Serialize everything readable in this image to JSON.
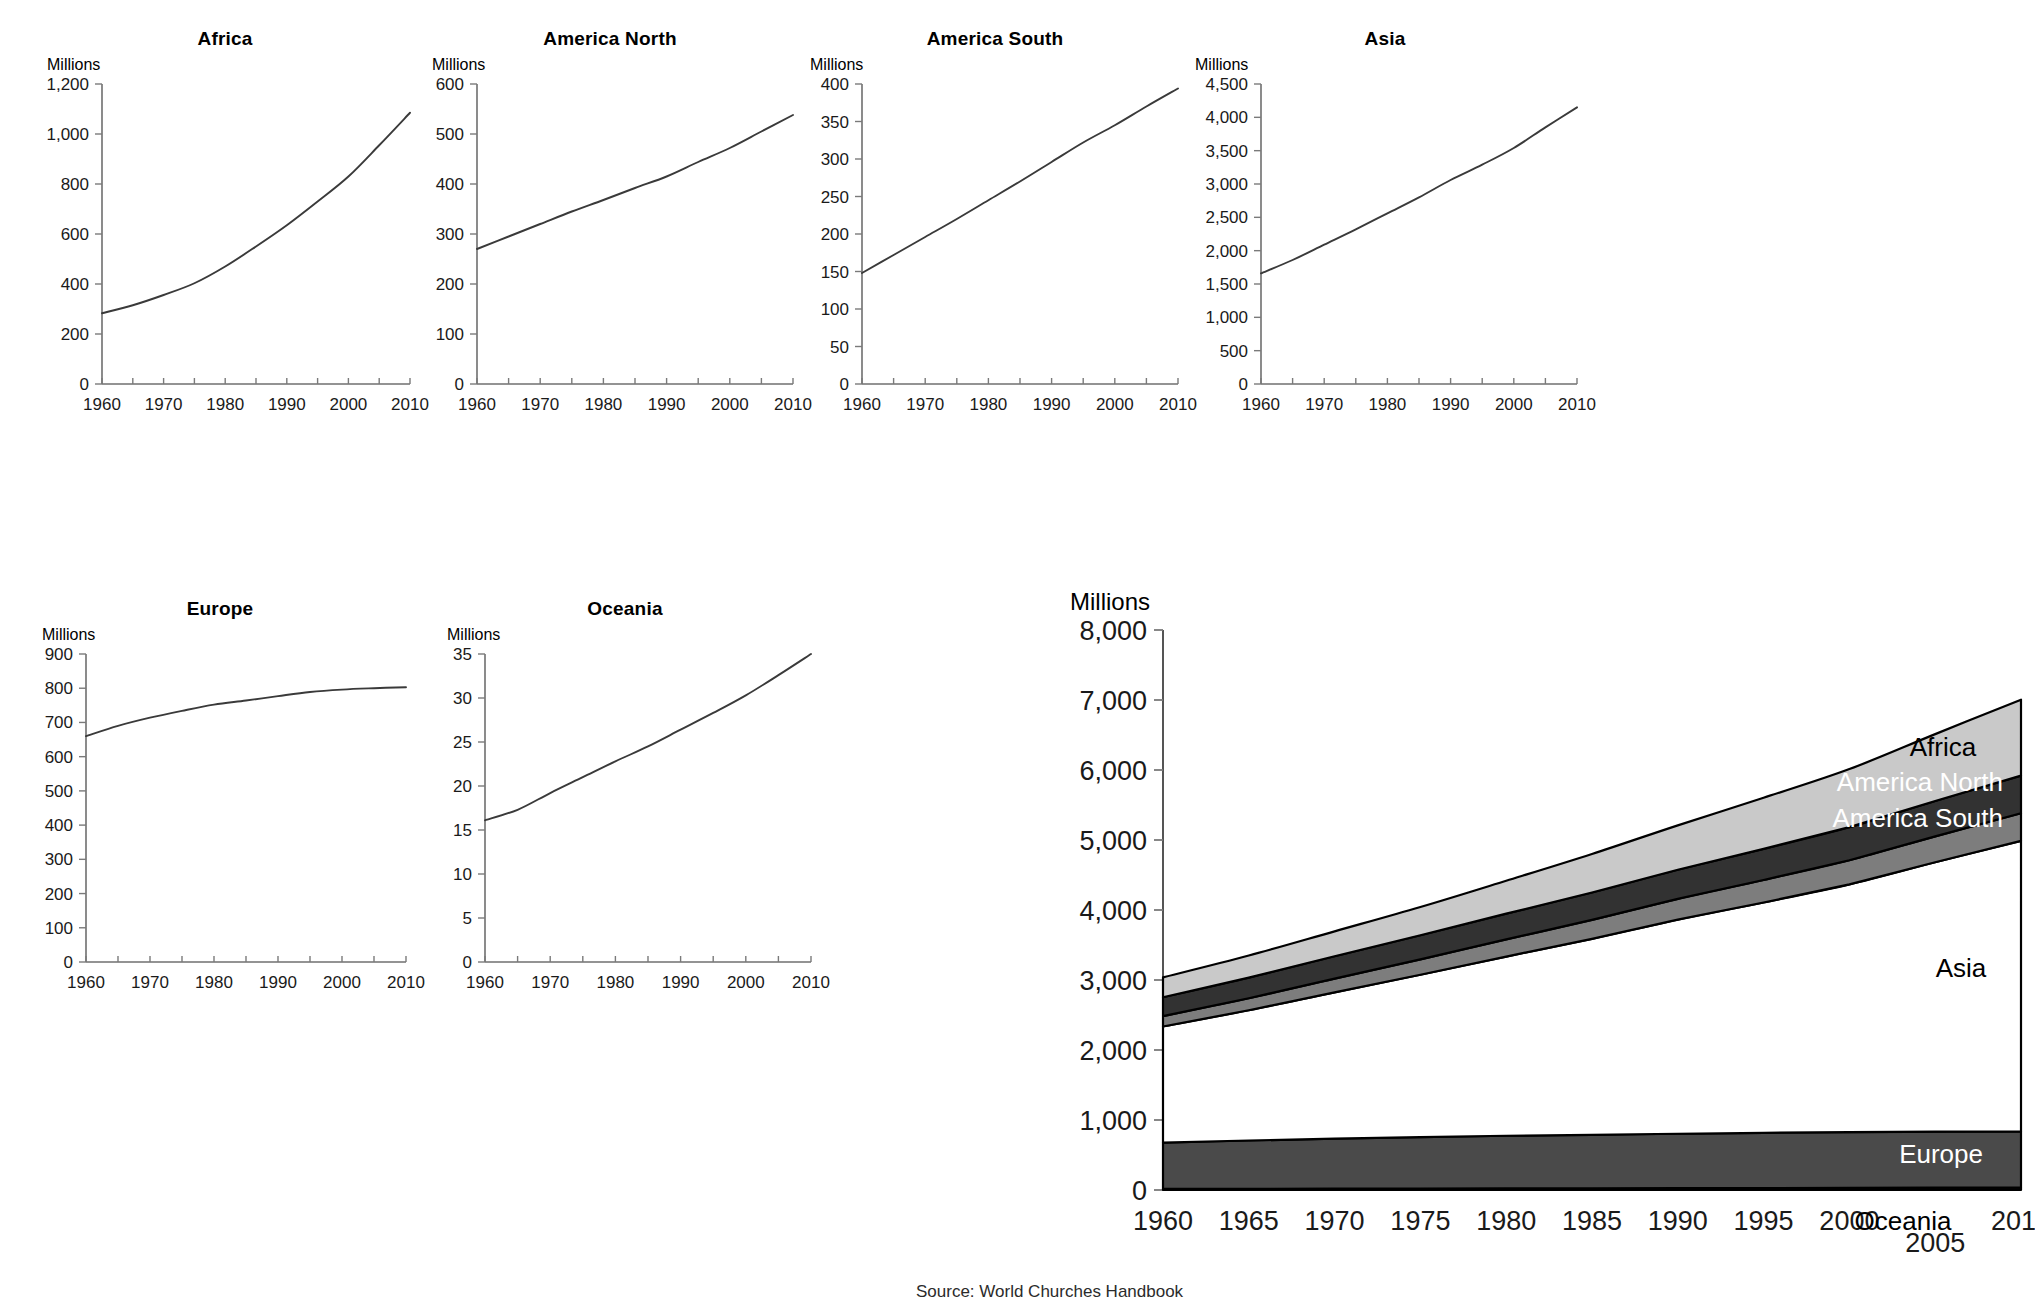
{
  "source_note": "Source: World Churches Handbook",
  "unit_label": "Millions",
  "titles": {
    "africa": "Africa",
    "america_north": "America North",
    "america_south": "America South",
    "asia": "Asia",
    "europe": "Europe",
    "oceania": "Oceania"
  },
  "stacked_labels": {
    "africa": "Africa",
    "america_north": "America North",
    "america_south": "America South",
    "asia": "Asia",
    "europe": "Europe",
    "oceania": "Oceania"
  },
  "colors": {
    "africa": "#c9c9c9",
    "america_north": "#323232",
    "america_south": "#7d7d7d",
    "asia": "#ffffff",
    "europe": "#4a4a4a",
    "oceania": "#111111",
    "line": "#3a3a3a",
    "axis": "#6f6f6f"
  },
  "chart_data": [
    {
      "type": "line",
      "title": "Africa",
      "xlabel": "",
      "ylabel": "Millions",
      "xlim": [
        1960,
        2010
      ],
      "ylim": [
        0,
        1200
      ],
      "ytick_labels": [
        "0",
        "200",
        "400",
        "600",
        "800",
        "1,000",
        "1,200"
      ],
      "yticks": [
        0,
        200,
        400,
        600,
        800,
        1000,
        1200
      ],
      "xtick_labels": [
        "1960",
        "1970",
        "1980",
        "1990",
        "2000",
        "2010"
      ],
      "xticks": [
        1960,
        1970,
        1980,
        1990,
        2000,
        2010
      ],
      "xminor": [
        1965,
        1975,
        1985,
        1995,
        2005
      ],
      "grid": false,
      "x": [
        1960,
        1965,
        1970,
        1975,
        1980,
        1985,
        1990,
        1995,
        2000,
        2005,
        2010
      ],
      "values": [
        283,
        315,
        356,
        403,
        470,
        550,
        635,
        730,
        830,
        955,
        1085
      ]
    },
    {
      "type": "line",
      "title": "America North",
      "xlabel": "",
      "ylabel": "Millions",
      "xlim": [
        1960,
        2010
      ],
      "ylim": [
        0,
        600
      ],
      "ytick_labels": [
        "0",
        "100",
        "200",
        "300",
        "400",
        "500",
        "600"
      ],
      "yticks": [
        0,
        100,
        200,
        300,
        400,
        500,
        600
      ],
      "xtick_labels": [
        "1960",
        "1970",
        "1980",
        "1990",
        "2000",
        "2010"
      ],
      "xticks": [
        1960,
        1970,
        1980,
        1990,
        2000,
        2010
      ],
      "xminor": [
        1965,
        1975,
        1985,
        1995,
        2005
      ],
      "grid": false,
      "x": [
        1960,
        1965,
        1970,
        1975,
        1980,
        1985,
        1990,
        1995,
        2000,
        2005,
        2010
      ],
      "values": [
        270,
        295,
        320,
        345,
        368,
        392,
        415,
        444,
        472,
        505,
        538
      ]
    },
    {
      "type": "line",
      "title": "America South",
      "xlabel": "",
      "ylabel": "Millions",
      "xlim": [
        1960,
        2010
      ],
      "ylim": [
        0,
        400
      ],
      "ytick_labels": [
        "0",
        "50",
        "100",
        "150",
        "200",
        "250",
        "300",
        "350",
        "400"
      ],
      "yticks": [
        0,
        50,
        100,
        150,
        200,
        250,
        300,
        350,
        400
      ],
      "xtick_labels": [
        "1960",
        "1970",
        "1980",
        "1990",
        "2000",
        "2010"
      ],
      "xticks": [
        1960,
        1970,
        1980,
        1990,
        2000,
        2010
      ],
      "xminor": [
        1965,
        1975,
        1985,
        1995,
        2005
      ],
      "grid": false,
      "x": [
        1960,
        1965,
        1970,
        1975,
        1980,
        1985,
        1990,
        1995,
        2000,
        2005,
        2010
      ],
      "values": [
        148,
        172,
        196,
        220,
        245,
        270,
        296,
        322,
        345,
        370,
        394
      ]
    },
    {
      "type": "line",
      "title": "Asia",
      "xlabel": "",
      "ylabel": "Millions",
      "xlim": [
        1960,
        2010
      ],
      "ylim": [
        0,
        4500
      ],
      "ytick_labels": [
        "0",
        "500",
        "1,000",
        "1,500",
        "2,000",
        "2,500",
        "3,000",
        "3,500",
        "4,000",
        "4,500"
      ],
      "yticks": [
        0,
        500,
        1000,
        1500,
        2000,
        2500,
        3000,
        3500,
        4000,
        4500
      ],
      "xtick_labels": [
        "1960",
        "1970",
        "1980",
        "1990",
        "2000",
        "2010"
      ],
      "xticks": [
        1960,
        1970,
        1980,
        1990,
        2000,
        2010
      ],
      "xminor": [
        1965,
        1975,
        1985,
        1995,
        2005
      ],
      "grid": false,
      "x": [
        1960,
        1965,
        1970,
        1975,
        1980,
        1985,
        1990,
        1995,
        2000,
        2005,
        2010
      ],
      "values": [
        1660,
        1860,
        2090,
        2320,
        2560,
        2800,
        3060,
        3290,
        3540,
        3850,
        4150
      ]
    },
    {
      "type": "line",
      "title": "Europe",
      "xlabel": "",
      "ylabel": "Millions",
      "xlim": [
        1960,
        2010
      ],
      "ylim": [
        0,
        900
      ],
      "ytick_labels": [
        "0",
        "100",
        "200",
        "300",
        "400",
        "500",
        "600",
        "700",
        "800",
        "900"
      ],
      "yticks": [
        0,
        100,
        200,
        300,
        400,
        500,
        600,
        700,
        800,
        900
      ],
      "xtick_labels": [
        "1960",
        "1970",
        "1980",
        "1990",
        "2000",
        "2010"
      ],
      "xticks": [
        1960,
        1970,
        1980,
        1990,
        2000,
        2010
      ],
      "xminor": [
        1965,
        1975,
        1985,
        1995,
        2005
      ],
      "grid": false,
      "x": [
        1960,
        1965,
        1970,
        1975,
        1980,
        1985,
        1990,
        1995,
        2000,
        2005,
        2010
      ],
      "values": [
        660,
        690,
        714,
        734,
        752,
        764,
        777,
        789,
        796,
        800,
        803
      ]
    },
    {
      "type": "line",
      "title": "Oceania",
      "xlabel": "",
      "ylabel": "Millions",
      "xlim": [
        1960,
        2010
      ],
      "ylim": [
        0,
        35
      ],
      "ytick_labels": [
        "0",
        "5",
        "10",
        "15",
        "20",
        "25",
        "30",
        "35"
      ],
      "yticks": [
        0,
        5,
        10,
        15,
        20,
        25,
        30,
        35
      ],
      "xtick_labels": [
        "1960",
        "1970",
        "1980",
        "1990",
        "2000",
        "2010"
      ],
      "xticks": [
        1960,
        1970,
        1980,
        1990,
        2000,
        2010
      ],
      "xminor": [
        1965,
        1975,
        1985,
        1995,
        2005
      ],
      "grid": false,
      "x": [
        1960,
        1965,
        1970,
        1975,
        1980,
        1985,
        1990,
        1995,
        2000,
        2005,
        2010
      ],
      "values": [
        16.1,
        17.3,
        19.2,
        21.0,
        22.8,
        24.5,
        26.4,
        28.3,
        30.3,
        32.6,
        35.0
      ]
    },
    {
      "type": "area",
      "title": "",
      "xlabel": "",
      "ylabel": "Millions",
      "stacked": true,
      "legend_position": "inline-right",
      "xlim": [
        1960,
        2010
      ],
      "ylim": [
        0,
        8000
      ],
      "ytick_labels": [
        "0",
        "1,000",
        "2,000",
        "3,000",
        "4,000",
        "5,000",
        "6,000",
        "7,000",
        "8,000"
      ],
      "yticks": [
        0,
        1000,
        2000,
        3000,
        4000,
        5000,
        6000,
        7000,
        8000
      ],
      "xtick_labels": [
        "1960",
        "1965",
        "1970",
        "1975",
        "1980",
        "1985",
        "1990",
        "1995",
        "2000",
        "2005",
        "2010"
      ],
      "xticks": [
        1960,
        1965,
        1970,
        1975,
        1980,
        1985,
        1990,
        1995,
        2000,
        2005,
        2010
      ],
      "grid": false,
      "x": [
        1960,
        1965,
        1970,
        1975,
        1980,
        1985,
        1990,
        1995,
        2000,
        2005,
        2010
      ],
      "stack_order": [
        "Oceania",
        "Europe",
        "Asia",
        "America South",
        "America North",
        "Africa"
      ],
      "series": [
        {
          "name": "Oceania",
          "values": [
            16.1,
            17.3,
            19.2,
            21.0,
            22.8,
            24.5,
            26.4,
            28.3,
            30.3,
            32.6,
            35.0
          ]
        },
        {
          "name": "Europe",
          "values": [
            660,
            690,
            714,
            734,
            752,
            764,
            777,
            789,
            796,
            800,
            803
          ]
        },
        {
          "name": "Asia",
          "values": [
            1660,
            1860,
            2090,
            2320,
            2560,
            2800,
            3060,
            3290,
            3540,
            3850,
            4150
          ]
        },
        {
          "name": "America South",
          "values": [
            148,
            172,
            196,
            220,
            245,
            270,
            296,
            322,
            345,
            370,
            394
          ]
        },
        {
          "name": "America North",
          "values": [
            270,
            295,
            320,
            345,
            368,
            392,
            415,
            444,
            472,
            505,
            538
          ]
        },
        {
          "name": "Africa",
          "values": [
            283,
            315,
            356,
            403,
            470,
            550,
            635,
            730,
            830,
            955,
            1085
          ]
        }
      ]
    }
  ]
}
